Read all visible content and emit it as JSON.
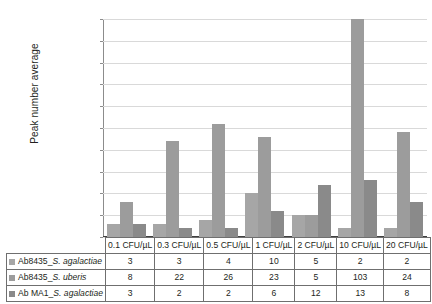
{
  "chart_data": {
    "type": "bar",
    "title": "",
    "xlabel": "",
    "ylabel": "Peak number average",
    "ylim": [
      0,
      50
    ],
    "ytick_step": 5,
    "yticks": [
      0,
      5,
      10,
      15,
      20,
      25,
      30,
      35,
      40,
      45,
      50
    ],
    "grid": true,
    "legend_position": "data-table-below",
    "categories": [
      "0.1 CFU/µL",
      "0.3 CFU/µL",
      "0.5 CFU/µL",
      "1 CFU/µL",
      "2 CFU/µL",
      "10 CFU/µL",
      "20 CFU/µL"
    ],
    "series": [
      {
        "name": "Ab8435_S. agalactiae",
        "name_prefix": "Ab8435_",
        "name_italic": "S. agalactiae",
        "color": "#a6a6a6",
        "values": [
          3,
          3,
          4,
          10,
          5,
          2,
          2
        ]
      },
      {
        "name": "Ab8435_S. uberis",
        "name_prefix": "Ab8435_",
        "name_italic": "S. uberis",
        "color": "#9c9c9c",
        "values": [
          8,
          22,
          26,
          23,
          5,
          103,
          24
        ]
      },
      {
        "name": "Ab MA1_S. agalactiae",
        "name_prefix": "Ab MA1_",
        "name_italic": "S. agalactiae",
        "color": "#8a8a8a",
        "values": [
          3,
          2,
          2,
          6,
          12,
          13,
          8
        ]
      }
    ]
  }
}
